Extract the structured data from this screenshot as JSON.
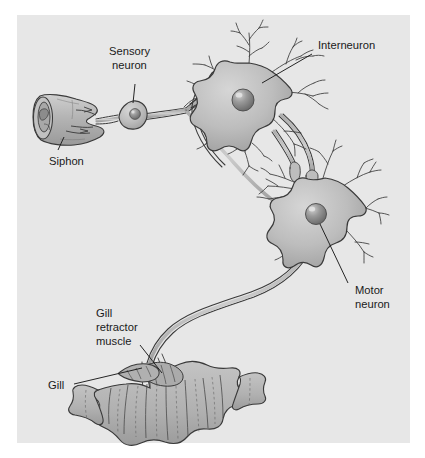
{
  "figure": {
    "background_color": "#ffffff",
    "panel_color": "#e7e7e7",
    "ink_color": "#1a1a1a",
    "cell_fill_color": "#b8b8b8",
    "tissue_fill_color": "#b5b5b5"
  },
  "labels": {
    "sensory_neuron_line1": "Sensory",
    "sensory_neuron_line2": "neuron",
    "interneuron": "Interneuron",
    "motor_neuron_line1": "Motor",
    "motor_neuron_line2": "neuron",
    "siphon": "Siphon",
    "gill_retractor_line1": "Gill",
    "gill_retractor_line2": "retractor",
    "gill_retractor_line3": "muscle",
    "gill": "Gill"
  },
  "structures": {
    "siphon": "siphon-tube",
    "sensory_neuron": "sensory-neuron-soma",
    "interneuron": "interneuron-soma",
    "motor_neuron": "motor-neuron-soma",
    "gill": "gill-organ",
    "gill_retractor_muscle": "gill-retractor-muscle"
  }
}
